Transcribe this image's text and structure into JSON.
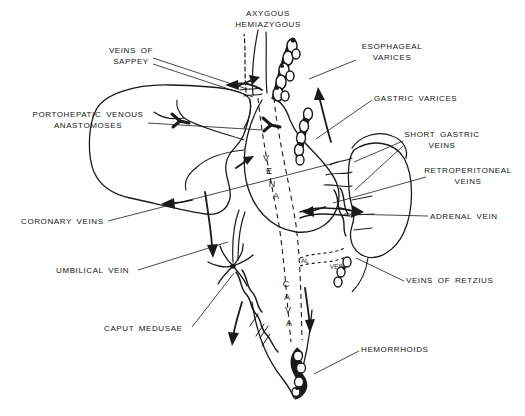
{
  "figure": {
    "background_color": "#ffffff",
    "ink_color": "#1a1a1a",
    "labels": {
      "azygous": {
        "line1": "AXYGOUS",
        "line2": "HEMIAZYGOUS"
      },
      "sappey": {
        "line1": "VEINS OF",
        "line2": "SAPPEY"
      },
      "esophageal": {
        "line1": "ESOPHAGEAL",
        "line2": "VARICES"
      },
      "gastric": {
        "line1": "GASTRIC VARICES"
      },
      "portohepatic": {
        "line1": "PORTOHEPATIC VENOUS",
        "line2": "ANASTOMOSES"
      },
      "short_gastric": {
        "line1": "SHORT GASTRIC",
        "line2": "VEINS"
      },
      "retroperitoneal": {
        "line1": "RETROPERITONEAL",
        "line2": "VEINS"
      },
      "adrenal": {
        "line1": "ADRENAL VEIN"
      },
      "coronary": {
        "line1": "CORONARY VEINS"
      },
      "umbilical": {
        "line1": "UMBILICAL VEIN"
      },
      "retzius": {
        "line1": "VEINS OF RETZIUS"
      },
      "caput": {
        "line1": "CAPUT MEDUSAE"
      },
      "hemorrhoids": {
        "line1": "HEMORRHOIDS"
      }
    },
    "vessel_text": {
      "vena": [
        "V",
        "E",
        "N",
        "A"
      ],
      "cava": [
        "C",
        "A",
        "V",
        "A"
      ],
      "renal_fragment_1": "AL",
      "renal_fragment_2": "VEIN"
    }
  }
}
